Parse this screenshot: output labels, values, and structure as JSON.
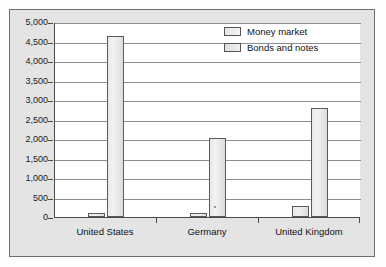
{
  "chart_data": {
    "type": "bar",
    "title": "",
    "xlabel": "",
    "ylabel": "",
    "ylim": [
      0,
      5000
    ],
    "ytick_step": 500,
    "grid": true,
    "legend_position": "top-right",
    "categories": [
      "United States",
      "Germany",
      "United Kingdom"
    ],
    "ytick_labels": [
      "5,000",
      "4,500",
      "4,000",
      "3,500",
      "3,000",
      "2,500",
      "2,000",
      "1,500",
      "1,000",
      "500",
      "0"
    ],
    "ytick_values": [
      5000,
      4500,
      4000,
      3500,
      3000,
      2500,
      2000,
      1500,
      1000,
      500,
      0
    ],
    "series": [
      {
        "name": "Money market",
        "values": [
          100,
          100,
          270
        ]
      },
      {
        "name": "Bonds and notes",
        "values": [
          4650,
          2030,
          2800
        ]
      }
    ]
  },
  "legend": {
    "items": [
      {
        "label": "Money market"
      },
      {
        "label": "Bonds and notes"
      }
    ]
  },
  "ghost_text": {
    "line1": "Calculating Returns on a Eurobond",
    "line2": "Issues and the Maturity of Debt",
    "line3": "market and the rate of return",
    "line4": "an example of a bond",
    "line5": "the outstanding value of"
  }
}
